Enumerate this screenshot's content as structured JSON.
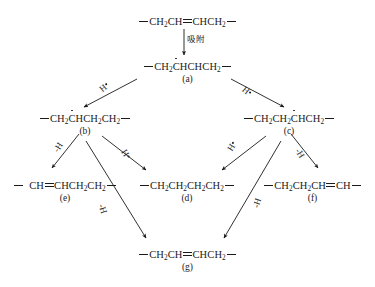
{
  "diagram": {
    "title_text": "",
    "nodes": [
      {
        "id": "top",
        "formula_text": "—CH2CH=CHCH2—",
        "label": ""
      },
      {
        "id": "a",
        "formula_text": "—CH2ĊHCHCH2—",
        "label": "(a)"
      },
      {
        "id": "b",
        "formula_text": "—CH2ĊHCH2CH2—",
        "label": "(b)"
      },
      {
        "id": "c",
        "formula_text": "—CH2CH2ĊHCH2—",
        "label": "(c)"
      },
      {
        "id": "e",
        "formula_text": "— CH=CHCH2CH2—",
        "label": "(e)"
      },
      {
        "id": "d",
        "formula_text": "—CH2CH2CH2CH2—",
        "label": "(d)"
      },
      {
        "id": "f",
        "formula_text": "—CH2CH2CH=CH—",
        "label": "(f)"
      },
      {
        "id": "g",
        "formula_text": "—CH2CH=CHCH2—",
        "label": "(g)"
      }
    ],
    "edge_labels": {
      "adsorption": "吸附",
      "h_radical": "H",
      "minus_h": "-H"
    },
    "colors": {
      "ink": "#1a1a1a",
      "background": "#ffffff"
    }
  }
}
